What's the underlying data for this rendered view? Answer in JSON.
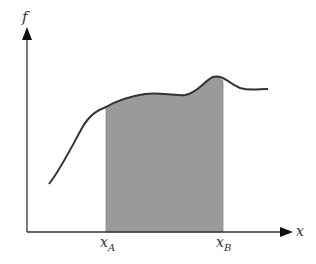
{
  "diagram": {
    "type": "definite-integral-area",
    "y_axis_label": "f",
    "x_axis_label": "x",
    "bounds": [
      {
        "name": "x_A",
        "base": "x",
        "sub": "A"
      },
      {
        "name": "x_B",
        "base": "x",
        "sub": "B"
      }
    ],
    "colors": {
      "axis": "#333333",
      "curve": "#333333",
      "shaded_area": "#9a9a9a",
      "background": "#ffffff"
    }
  }
}
